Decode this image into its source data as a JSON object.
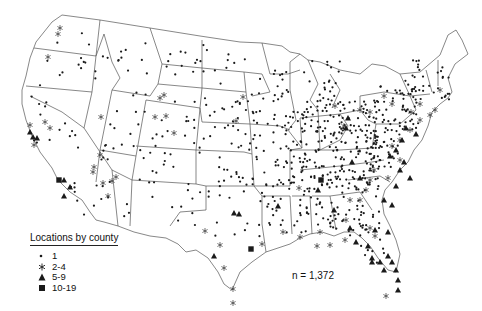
{
  "map": {
    "title": "Locations by county",
    "region": "Contiguous United States",
    "annotation": "n = 1,372",
    "colors": {
      "outline": "#555555",
      "marker": "#1a1a1a",
      "background": "#ffffff"
    }
  },
  "legend": {
    "title": "Locations by county",
    "items": [
      {
        "symbol": "dot",
        "label": "1"
      },
      {
        "symbol": "asterisk",
        "label": "2-4"
      },
      {
        "symbol": "triangle",
        "label": "5-9"
      },
      {
        "symbol": "square",
        "label": "10-19"
      }
    ]
  }
}
